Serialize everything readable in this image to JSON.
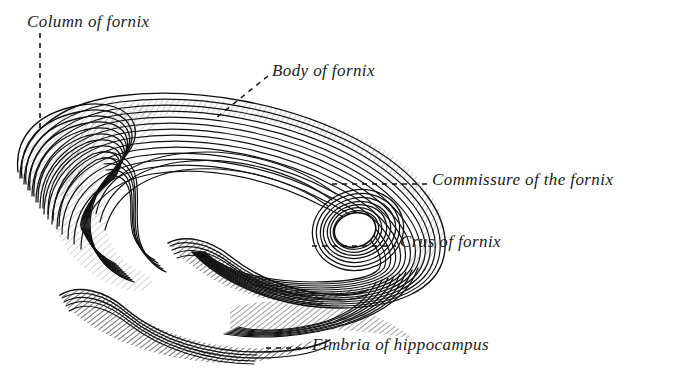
{
  "figure": {
    "title": "Fornix",
    "background_color": "#ffffff",
    "ink_color": "#111111",
    "signature": "M.£8"
  },
  "labels": [
    {
      "id": "column-of-fornix",
      "text": "Column of fornix",
      "leader": "vertical-dashed"
    },
    {
      "id": "body-of-fornix",
      "text": "Body of fornix",
      "leader": "diagonal-dashed"
    },
    {
      "id": "commissure-of-the-fornix",
      "text": "Commissure of the fornix",
      "leader": "horizontal-dashed"
    },
    {
      "id": "crus-of-fornix",
      "text": "Crus of fornix",
      "leader": "horizontal-dashed"
    },
    {
      "id": "fimbria-of-hippocampus",
      "text": "Fimbria of hippocampus",
      "leader": "horizontal-dashed"
    }
  ]
}
